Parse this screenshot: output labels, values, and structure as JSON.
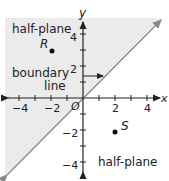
{
  "diagram": {
    "axes": {
      "x_label": "x",
      "y_label": "y",
      "origin_label": "O"
    },
    "x_ticks": [
      "−4",
      "−2",
      "2",
      "4"
    ],
    "y_ticks": [
      "4",
      "2",
      "−2",
      "−4"
    ],
    "labels": {
      "upper_half_plane": "half-plane",
      "lower_half_plane": "half-plane",
      "boundary_line_1": "boundary",
      "boundary_line_2": "line"
    },
    "points": [
      {
        "name": "R",
        "x": -2,
        "y": 3
      },
      {
        "name": "S",
        "x": 2,
        "y": -2
      }
    ],
    "boundary": "y = x",
    "shaded_region": "above boundary line",
    "colors": {
      "shade": "#ebebeb",
      "boundary": "#8a8a8a",
      "axis": "#222222"
    }
  }
}
